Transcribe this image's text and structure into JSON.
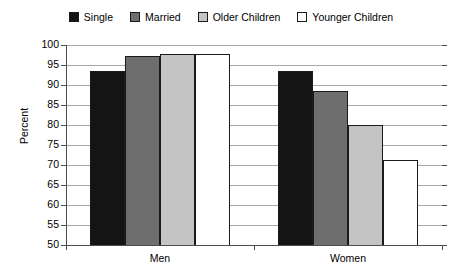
{
  "legend": {
    "position": "top-center",
    "items": [
      {
        "label": "Single",
        "color": "#141414"
      },
      {
        "label": "Married",
        "color": "#6e6e6e"
      },
      {
        "label": "Older Children",
        "color": "#c4c4c4"
      },
      {
        "label": "Younger Children",
        "color": "#ffffff"
      }
    ]
  },
  "axes": {
    "ylabel": "Percent",
    "xlabel": "",
    "yticks": [
      100,
      95,
      90,
      85,
      80,
      75,
      70,
      65,
      60,
      55,
      50
    ],
    "ylim": [
      50,
      100
    ],
    "categories": [
      "Men",
      "Women"
    ]
  },
  "chart_data": {
    "type": "bar",
    "title": "",
    "subtitle": "",
    "xlabel": "",
    "ylabel": "Percent",
    "ylim": [
      50,
      100
    ],
    "ytick_step": 5,
    "grid": true,
    "legend_position": "top-center",
    "categories": [
      "Men",
      "Women"
    ],
    "series": [
      {
        "name": "Single",
        "color": "#141414",
        "values": [
          93.5,
          93.5
        ]
      },
      {
        "name": "Married",
        "color": "#6e6e6e",
        "values": [
          97.3,
          88.5
        ]
      },
      {
        "name": "Older Children",
        "color": "#c4c4c4",
        "values": [
          97.8,
          80.0
        ]
      },
      {
        "name": "Younger Children",
        "color": "#ffffff",
        "values": [
          97.8,
          71.2
        ]
      }
    ]
  }
}
